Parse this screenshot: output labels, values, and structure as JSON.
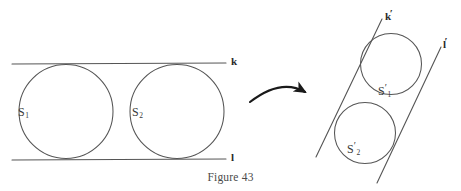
{
  "figure": {
    "caption": "Figure 43",
    "stroke_color": "#555555",
    "arrow_color": "#1a1a1a",
    "text_color": "#3a3a3a",
    "background": "#ffffff",
    "width": 461,
    "height": 191
  },
  "left_panel": {
    "description": "Two congruent circles tangent to each other and to two parallel horizontal lines k and l",
    "lines": [
      {
        "name": "k",
        "label": "k",
        "label_x": 231,
        "label_y": 56,
        "x1": 12,
        "y1": 64,
        "x2": 226,
        "y2": 63
      },
      {
        "name": "l",
        "label": "l",
        "label_x": 231,
        "label_y": 152,
        "x1": 12,
        "y1": 160,
        "x2": 226,
        "y2": 159
      }
    ],
    "circles": [
      {
        "name": "S1",
        "label": "S",
        "subscript": "1",
        "cx": 66,
        "cy": 111,
        "r": 47,
        "label_x": 18,
        "label_y": 106
      },
      {
        "name": "S2",
        "label": "S",
        "subscript": "2",
        "cx": 177,
        "cy": 111,
        "r": 47,
        "label_x": 132,
        "label_y": 106
      }
    ]
  },
  "arrow": {
    "name": "transformation-arrow",
    "description": "curved arrow pointing right from left figure to right figure",
    "start_x": 250,
    "start_y": 102,
    "ctrl_x": 282,
    "ctrl_y": 80,
    "end_x": 307,
    "end_y": 93
  },
  "right_panel": {
    "description": "Image of the configuration under a transformation: two circles tangent to two slanted parallel lines k-prime and l-prime",
    "lines": [
      {
        "name": "k-prime",
        "label": "k",
        "prime": "′",
        "label_x": 385,
        "label_y": 11,
        "x1": 382,
        "y1": 19,
        "x2": 316,
        "y2": 157
      },
      {
        "name": "l-prime",
        "label": "l",
        "prime": "′",
        "label_x": 443,
        "label_y": 39,
        "x1": 441,
        "y1": 47,
        "x2": 377,
        "y2": 183
      }
    ],
    "circles": [
      {
        "name": "S1-prime",
        "label": "S",
        "subscript": "1",
        "prime": "′",
        "cx": 391,
        "cy": 64,
        "r": 30,
        "label_x": 378,
        "label_y": 85
      },
      {
        "name": "S2-prime",
        "label": "S",
        "subscript": "2",
        "prime": "′",
        "cx": 365,
        "cy": 133,
        "r": 30,
        "label_x": 347,
        "label_y": 143
      }
    ]
  }
}
